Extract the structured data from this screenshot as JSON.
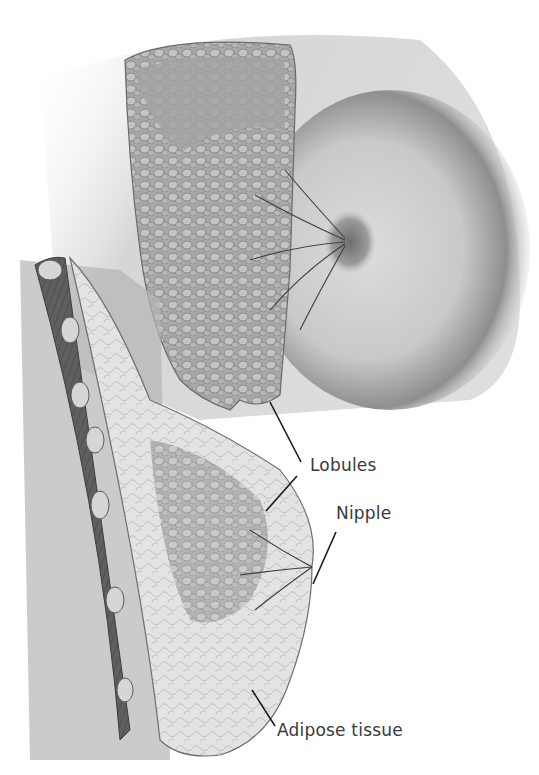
{
  "figure": {
    "views": [
      "External cutaway view",
      "Sagittal cross-section"
    ]
  },
  "labels": [
    {
      "id": "lobules",
      "text": "Lobules",
      "x": 310,
      "y": 465
    },
    {
      "id": "nipple",
      "text": "Nipple",
      "x": 336,
      "y": 511
    },
    {
      "id": "adipose",
      "text": "Adipose tissue",
      "x": 277,
      "y": 728
    }
  ],
  "colors": {
    "background": "#ffffff",
    "skin_light": "#e6e6e6",
    "skin_mid": "#b9b9b9",
    "skin_dark": "#7d7d7d",
    "tissue": "#9a9a9a",
    "muscle": "#5e5e5e",
    "fat": "#d8d8d8",
    "label_text": "#3a3a3a",
    "leader_line": "#1a1a1a"
  }
}
